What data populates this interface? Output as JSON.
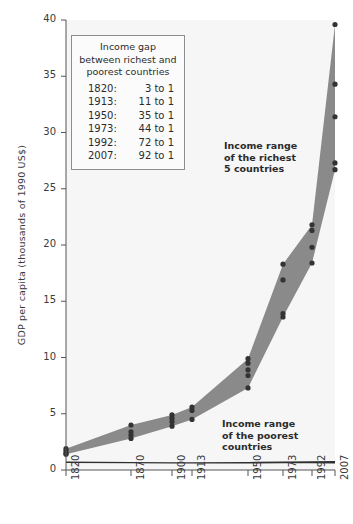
{
  "chart_data": {
    "type": "area",
    "title": "",
    "xlabel": "",
    "ylabel": "GDP per capita (thousands of 1990 US$)",
    "ylim": [
      0,
      40
    ],
    "yticks": [
      0,
      5,
      10,
      15,
      20,
      25,
      30,
      35,
      40
    ],
    "categories": [
      "1820",
      "1870",
      "1900",
      "1913",
      "1950",
      "1973",
      "1992",
      "2007"
    ],
    "x_positions": [
      66,
      131,
      172,
      192,
      248,
      283,
      312,
      335
    ],
    "grid": false,
    "legend_position": "inside-top-left",
    "series": [
      {
        "name": "Income range of the richest 5 countries",
        "type": "band",
        "upper": [
          1.9,
          4.0,
          4.9,
          5.6,
          9.9,
          18.3,
          21.8,
          39.6
        ],
        "lower": [
          1.4,
          2.8,
          3.9,
          4.5,
          7.3,
          13.6,
          18.4,
          26.7
        ]
      },
      {
        "name": "Income range of the poorest countries",
        "type": "band",
        "upper": [
          0.75,
          0.72,
          0.7,
          0.7,
          0.72,
          0.76,
          0.78,
          0.8
        ],
        "lower": [
          0.62,
          0.6,
          0.58,
          0.58,
          0.58,
          0.6,
          0.6,
          0.58
        ]
      }
    ],
    "points": {
      "1820": [
        1.9,
        1.7,
        1.5,
        1.4
      ],
      "1870": [
        4.0,
        3.4,
        3.1,
        2.8
      ],
      "1900": [
        4.9,
        4.6,
        4.3,
        3.9
      ],
      "1913": [
        5.6,
        5.3,
        4.5
      ],
      "1950": [
        9.9,
        9.5,
        8.9,
        8.4,
        7.3
      ],
      "1973": [
        18.3,
        16.9,
        13.9,
        13.6
      ],
      "1992": [
        21.8,
        21.3,
        19.8,
        18.4
      ],
      "2007": [
        39.6,
        34.3,
        31.4,
        27.3,
        26.7
      ]
    },
    "annotations": [
      {
        "name": "richest-label",
        "text": "Income range\nof the richest\n5 countries"
      },
      {
        "name": "poorest-label",
        "text": "Income range\nof the poorest\ncountries"
      }
    ],
    "colors": {
      "band": "#8a8a8a",
      "point": "#333333",
      "plot_background": "#f6f6f6",
      "axis": "#555555",
      "text": "#2b2b2b"
    }
  },
  "legend": {
    "title_line1": "Income gap",
    "title_line2": "between richest and",
    "title_line3": "poorest countries",
    "rows": [
      {
        "year": "1820:",
        "ratio": "3 to 1"
      },
      {
        "year": "1913:",
        "ratio": "11 to 1"
      },
      {
        "year": "1950:",
        "ratio": "35 to 1"
      },
      {
        "year": "1973:",
        "ratio": "44 to 1"
      },
      {
        "year": "1992:",
        "ratio": "72 to 1"
      },
      {
        "year": "2007:",
        "ratio": "92 to 1"
      }
    ]
  },
  "axes": {
    "y_title": "GDP per capita (thousands of 1990 US$)",
    "y_ticks": [
      "0",
      "5",
      "10",
      "15",
      "20",
      "25",
      "30",
      "35",
      "40"
    ],
    "x_ticks": [
      "1820",
      "1870",
      "1900",
      "1913",
      "1950",
      "1973",
      "1992",
      "2007"
    ]
  }
}
